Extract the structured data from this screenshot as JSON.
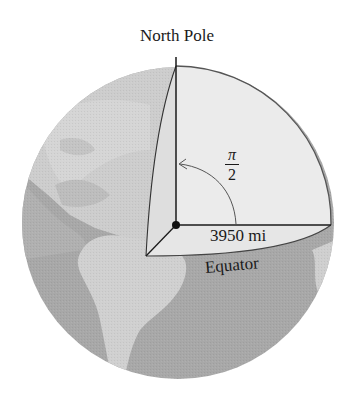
{
  "diagram": {
    "title": "North Pole",
    "radius_label": "3950 mi",
    "equator_label": "Equator",
    "angle_label": {
      "numerator": "π",
      "denominator": "2"
    },
    "elements": [
      "globe",
      "cut-away-quarter-wedge",
      "polar-axis",
      "equatorial-radius",
      "center-point",
      "angle-arc-arrow",
      "continents-north-and-south-america"
    ],
    "colors": {
      "ocean": "#a9a9a9",
      "land": "#cfcfcf",
      "land_north": "#d6d6d6",
      "wedge_face": "#ebebeb",
      "wedge_side": "#dcdcdc",
      "line": "#1a1a1a",
      "arc": "#555555"
    }
  }
}
